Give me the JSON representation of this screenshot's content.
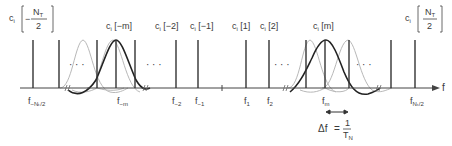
{
  "diagram": {
    "type": "OFDM subcarrier spectrum",
    "axis_label": "f",
    "top_labels": [
      {
        "id": "c-neg-N-half",
        "prefix": "c",
        "sub": "i",
        "index": "−N",
        "index_sub": "T",
        "denominator": "2",
        "fraction": true,
        "sign": "−"
      },
      {
        "id": "c-neg-m",
        "text": "c",
        "sub": "i",
        "index": "[−m]"
      },
      {
        "id": "c-neg-2",
        "text": "c",
        "sub": "i",
        "index": "[−2]"
      },
      {
        "id": "c-neg-1",
        "text": "c",
        "sub": "i",
        "index": "[−1]"
      },
      {
        "id": "c-1",
        "text": "c",
        "sub": "i",
        "index": "[1]"
      },
      {
        "id": "c-2",
        "text": "c",
        "sub": "i",
        "index": "[2]"
      },
      {
        "id": "c-m",
        "text": "c",
        "sub": "i",
        "index": "[m]"
      },
      {
        "id": "c-N-half",
        "prefix": "c",
        "sub": "i",
        "index": "N",
        "index_sub": "T",
        "denominator": "2",
        "fraction": true,
        "sign": ""
      }
    ],
    "bottom_labels": [
      {
        "id": "f-neg-N-half",
        "text": "f",
        "sub": "−Nₜ/2"
      },
      {
        "id": "f-neg-m",
        "text": "f",
        "sub": "−m"
      },
      {
        "id": "f-neg-2",
        "text": "f",
        "sub": "−2"
      },
      {
        "id": "f-neg-1",
        "text": "f",
        "sub": "−1"
      },
      {
        "id": "f-1",
        "text": "f",
        "sub": "1"
      },
      {
        "id": "f-2",
        "text": "f",
        "sub": "2"
      },
      {
        "id": "f-m",
        "text": "f",
        "sub": "m"
      },
      {
        "id": "f-N-half",
        "text": "f",
        "sub": "Nₜ/2"
      }
    ],
    "ellipsis": "· · ·",
    "spacing": {
      "lhs": "Δf",
      "equals": "=",
      "numerator": "1",
      "denominator": "T",
      "denominator_sub": "N"
    },
    "colors": {
      "line": "#333333",
      "faint_curve": "#b5b5b5",
      "bold_curve": "#222222"
    }
  }
}
